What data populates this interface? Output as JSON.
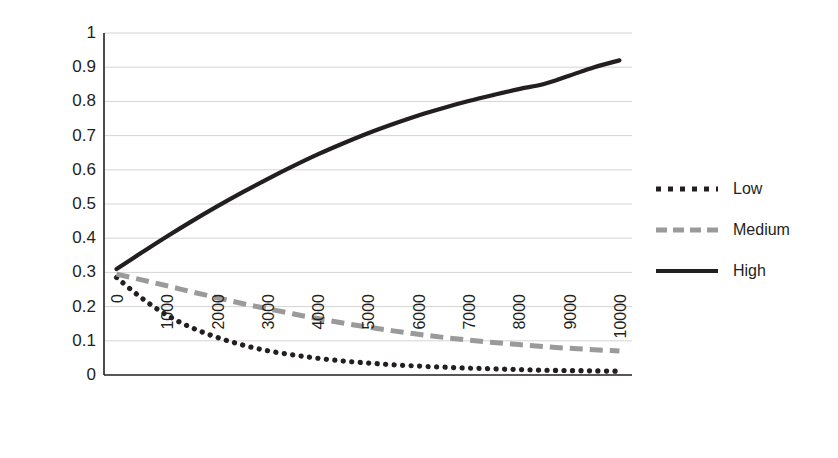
{
  "chart_data": {
    "type": "line",
    "title": "",
    "xlabel": "",
    "ylabel": "Predicted Probability",
    "xlim": [
      0,
      10500
    ],
    "ylim": [
      0,
      1
    ],
    "grid": true,
    "legend_position": "right",
    "x_ticks": [
      "0",
      "1000",
      "2000",
      "3000",
      "4000",
      "5000",
      "6000",
      "7000",
      "8000",
      "9000",
      "10000"
    ],
    "y_ticks": [
      "0",
      "0.1",
      "0.2",
      "0.3",
      "0.4",
      "0.5",
      "0.6",
      "0.7",
      "0.8",
      "0.9",
      "1"
    ],
    "x": [
      250,
      750,
      1250,
      1750,
      2250,
      2750,
      3250,
      3750,
      4250,
      4750,
      5250,
      5750,
      6250,
      6750,
      7250,
      7750,
      8250,
      8750,
      9250,
      9750,
      10250
    ],
    "series": [
      {
        "name": "Low",
        "style": "dotted",
        "color": "#231f20",
        "values": [
          0.285,
          0.225,
          0.175,
          0.138,
          0.11,
          0.088,
          0.071,
          0.059,
          0.049,
          0.041,
          0.035,
          0.03,
          0.026,
          0.023,
          0.02,
          0.018,
          0.016,
          0.014,
          0.013,
          0.012,
          0.011
        ]
      },
      {
        "name": "Medium",
        "style": "dashed",
        "color": "#9a9a9a",
        "values": [
          0.295,
          0.278,
          0.261,
          0.243,
          0.226,
          0.209,
          0.194,
          0.179,
          0.165,
          0.152,
          0.14,
          0.129,
          0.119,
          0.11,
          0.102,
          0.095,
          0.089,
          0.083,
          0.078,
          0.074,
          0.07
        ]
      },
      {
        "name": "High",
        "style": "solid",
        "color": "#231f20",
        "values": [
          0.31,
          0.358,
          0.405,
          0.45,
          0.493,
          0.534,
          0.573,
          0.61,
          0.645,
          0.677,
          0.707,
          0.734,
          0.759,
          0.781,
          0.801,
          0.819,
          0.836,
          0.851,
          0.875,
          0.9,
          0.92
        ]
      }
    ]
  },
  "legend": {
    "items": [
      {
        "label": "Low"
      },
      {
        "label": "Medium"
      },
      {
        "label": "High"
      }
    ]
  },
  "axis": {
    "y_title": "Predicted Probability"
  },
  "colors": {
    "line_black": "#231f20",
    "line_gray": "#9a9a9a",
    "gridline": "#d4d4d4",
    "axis": "#231f20",
    "background": "#ffffff"
  }
}
